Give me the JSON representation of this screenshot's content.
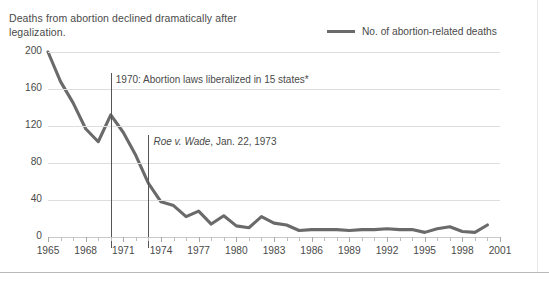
{
  "title": "Deaths from abortion declined dramatically after legalization.",
  "legend": {
    "label": "No. of abortion-related deaths",
    "color": "#6a6a6a"
  },
  "annotations": {
    "liberalization": {
      "text": "1970: Abortion laws liberalized in 15 states*",
      "year": 1970
    },
    "roe": {
      "italic": "Roe v. Wade",
      "rest": ", Jan. 22, 1973",
      "year": 1973
    }
  },
  "footnote": "",
  "chart_data": {
    "type": "line",
    "title": "Deaths from abortion declined dramatically after legalization.",
    "xlabel": "",
    "ylabel": "",
    "xlim": [
      1965,
      2001
    ],
    "ylim": [
      0,
      200
    ],
    "yticks": [
      0,
      40,
      80,
      120,
      160,
      200
    ],
    "xticks": [
      1965,
      1968,
      1971,
      1974,
      1977,
      1980,
      1983,
      1986,
      1989,
      1992,
      1995,
      1998,
      2001
    ],
    "grid": true,
    "legend_position": "top-right",
    "series": [
      {
        "name": "No. of abortion-related deaths",
        "color": "#6a6a6a",
        "x": [
          1965,
          1966,
          1967,
          1968,
          1969,
          1970,
          1971,
          1972,
          1973,
          1974,
          1975,
          1976,
          1977,
          1978,
          1979,
          1980,
          1981,
          1982,
          1983,
          1984,
          1985,
          1986,
          1987,
          1988,
          1989,
          1990,
          1991,
          1992,
          1993,
          1994,
          1995,
          1996,
          1997,
          1998,
          1999,
          2000
        ],
        "values": [
          200,
          168,
          145,
          117,
          103,
          132,
          113,
          88,
          58,
          38,
          34,
          22,
          28,
          14,
          23,
          12,
          10,
          22,
          15,
          13,
          7,
          8,
          8,
          8,
          7,
          8,
          8,
          9,
          8,
          8,
          5,
          9,
          11,
          6,
          5,
          13
        ]
      }
    ]
  }
}
